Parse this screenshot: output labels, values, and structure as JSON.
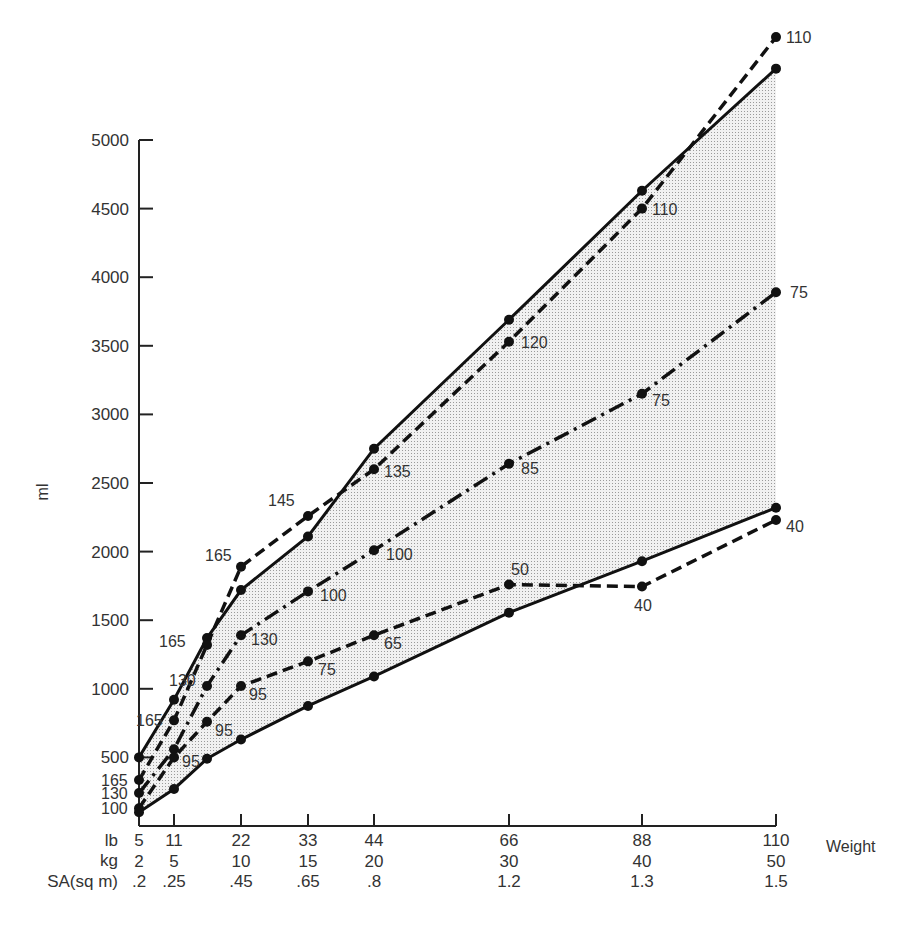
{
  "chart_data": {
    "type": "line",
    "title": "",
    "ylabel": "ml",
    "xlabel": "Weight",
    "ylim": [
      0,
      5000
    ],
    "grid": false,
    "y_ticks": [
      500,
      1000,
      1500,
      2000,
      2500,
      3000,
      3500,
      4000,
      4500,
      5000
    ],
    "x_axis_rows": [
      {
        "label": "lb",
        "values": [
          "5",
          "11",
          "22",
          "33",
          "44",
          "66",
          "88",
          "110"
        ]
      },
      {
        "label": "kg",
        "values": [
          "2",
          "5",
          "10",
          "15",
          "20",
          "30",
          "40",
          "50"
        ]
      },
      {
        "label": "SA(sq m)",
        "values": [
          ".2",
          ".25",
          ".45",
          ".65",
          ".8",
          "1.2",
          "1.3",
          "1.5"
        ]
      }
    ],
    "x_ticks_lb": [
      5,
      11,
      22,
      33,
      44,
      66,
      88,
      110
    ],
    "shaded_region": "between upper solid line and lower solid line",
    "series": [
      {
        "name": "upper-bound",
        "style": "solid",
        "x_lb": [
          5,
          11,
          16.5,
          22,
          33,
          44,
          66,
          88,
          110
        ],
        "values": [
          500,
          920,
          1370,
          1720,
          2110,
          2750,
          3690,
          4630,
          5520
        ],
        "point_labels": []
      },
      {
        "name": "dashed-high",
        "style": "dashed",
        "x_lb": [
          5,
          11,
          16.5,
          22,
          33,
          44,
          66,
          88,
          110
        ],
        "values": [
          335,
          770,
          1320,
          1890,
          2260,
          2600,
          3530,
          4500,
          5750
        ],
        "point_labels": [
          "165",
          "165",
          "165",
          "165",
          "145",
          "135",
          "120",
          "110",
          "110"
        ]
      },
      {
        "name": "dash-dot-mid",
        "style": "dashdot",
        "x_lb": [
          5,
          11,
          16.5,
          22,
          33,
          44,
          66,
          88,
          110
        ],
        "values": [
          240,
          560,
          1020,
          1390,
          1710,
          2010,
          2640,
          3150,
          3890
        ],
        "point_labels": [
          "130",
          "",
          "130",
          "130",
          "100",
          "100",
          "85",
          "75",
          "75"
        ]
      },
      {
        "name": "dashed-low",
        "style": "dashed",
        "x_lb": [
          5,
          11,
          16.5,
          22,
          33,
          44,
          66,
          88,
          110
        ],
        "values": [
          130,
          500,
          760,
          1020,
          1200,
          1390,
          1760,
          1745,
          2230
        ],
        "point_labels": [
          "100",
          "95",
          "95",
          "95",
          "75",
          "65",
          "50",
          "40",
          "40"
        ]
      },
      {
        "name": "lower-bound",
        "style": "solid",
        "x_lb": [
          5,
          11,
          16.5,
          22,
          33,
          44,
          66,
          88,
          110
        ],
        "values": [
          100,
          270,
          490,
          630,
          875,
          1090,
          1555,
          1930,
          2320
        ],
        "point_labels": []
      }
    ]
  },
  "labels": {
    "y_axis": "ml",
    "x_axis": "Weight",
    "row_lb": "lb",
    "row_kg": "kg",
    "row_sa": "SA(sq m)"
  },
  "colors": {
    "line": "#111111",
    "shade": "#d8d8d8",
    "text": "#333333"
  }
}
